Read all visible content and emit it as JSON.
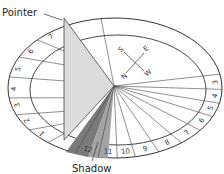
{
  "diagram": {
    "labels": {
      "pointer": "Pointer",
      "shadow": "Shadow"
    },
    "compass": {
      "north": "N",
      "south": "S",
      "east": "E",
      "west": "W"
    },
    "hour_marks_left": [
      "1",
      "2",
      "3",
      "4",
      "5",
      "6",
      "7"
    ],
    "hour_marks_bottom": [
      "12",
      "11",
      "10",
      "9",
      "8",
      "7",
      "6",
      "5",
      "4",
      "3"
    ],
    "colors": {
      "outline": "#333333",
      "pointer_fill": "#d8d8d8",
      "shadow_dark": "#7a7a7a",
      "shadow_mid": "#9e9e9e"
    }
  }
}
